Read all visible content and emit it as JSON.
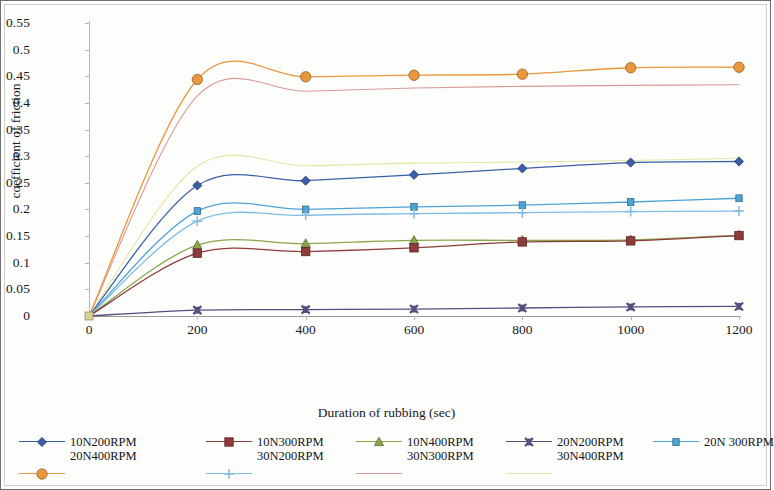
{
  "chart_data": {
    "type": "line",
    "title": "",
    "xlabel": "Duration of rubbing (sec)",
    "ylabel": "coefficient of friction",
    "x": [
      0,
      200,
      400,
      600,
      800,
      1000,
      1200
    ],
    "xticks": [
      "0",
      "200",
      "400",
      "600",
      "800",
      "1000",
      "1200"
    ],
    "yticks": [
      "0.55",
      "0.5",
      "0.45",
      "0.4",
      "0.35",
      "0.3",
      "0.25",
      "0.2",
      "0.15",
      "0.1",
      "0.05",
      "0"
    ],
    "ytickvalues": [
      0.55,
      0.5,
      0.45,
      0.4,
      0.35,
      0.3,
      0.25,
      0.2,
      0.15,
      0.1,
      0.05,
      0
    ],
    "xlim": [
      0,
      1200
    ],
    "ylim": [
      0,
      0.55
    ],
    "grid": false,
    "legend_position": "bottom",
    "series": [
      {
        "name": "10N200RPM",
        "color": "#3a5fa8",
        "marker": "diamond",
        "values": [
          0.0,
          0.245,
          0.254,
          0.265,
          0.277,
          0.288,
          0.29
        ]
      },
      {
        "name": "10N300RPM",
        "color": "#8e3b3b",
        "marker": "square",
        "values": [
          0.0,
          0.118,
          0.121,
          0.128,
          0.139,
          0.141,
          0.151
        ]
      },
      {
        "name": "10N400RPM",
        "color": "#8aa84a",
        "marker": "triangle",
        "values": [
          0.0,
          0.133,
          0.136,
          0.142,
          0.142,
          0.143,
          0.152
        ]
      },
      {
        "name": "20N200RPM",
        "color": "#544f7d",
        "marker": "x",
        "values": [
          0.0,
          0.011,
          0.012,
          0.013,
          0.015,
          0.017,
          0.018
        ]
      },
      {
        "name": "20N 300RPM",
        "color": "#4ea3d6",
        "marker": "square-small",
        "values": [
          0.0,
          0.197,
          0.2,
          0.205,
          0.208,
          0.214,
          0.221
        ]
      },
      {
        "name": "20N400RPM",
        "color": "#e8973c",
        "marker": "circle",
        "values": [
          0.0,
          0.444,
          0.449,
          0.452,
          0.454,
          0.466,
          0.467
        ]
      },
      {
        "name": "30N200RPM",
        "color": "#7fbde4",
        "marker": "plus",
        "values": [
          0.0,
          0.178,
          0.189,
          0.192,
          0.194,
          0.196,
          0.197
        ]
      },
      {
        "name": "30N300RPM",
        "color": "#d99a9a",
        "marker": "none",
        "values": [
          0.0,
          0.413,
          0.422,
          0.428,
          0.431,
          0.433,
          0.434
        ]
      },
      {
        "name": "30N400RPM",
        "color": "#e3e6a8",
        "marker": "none",
        "values": [
          0.0,
          0.281,
          0.282,
          0.287,
          0.289,
          0.292,
          0.296
        ]
      }
    ]
  },
  "legend": {
    "row1": [
      "10N200RPM",
      "10N300RPM",
      "10N400RPM",
      "20N200RPM",
      "20N 300RPM"
    ],
    "row2": [
      "20N400RPM",
      "30N200RPM",
      "30N300RPM",
      "30N400RPM"
    ]
  }
}
